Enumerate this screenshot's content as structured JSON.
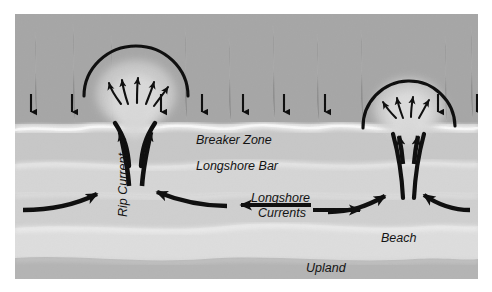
{
  "figure": {
    "type": "diagram",
    "background_color": "#ffffff",
    "frame": {
      "x": 15,
      "y": 14,
      "width": 463,
      "height": 265,
      "border_color": "#ffffff"
    }
  },
  "zones": [
    {
      "name": "open-ocean-water",
      "label": "",
      "color": "#a6a6a6",
      "y_top": 0,
      "y_bottom": 112
    },
    {
      "name": "breaker-foam-band",
      "label": "",
      "color": "#e2e2e2",
      "y_top": 108,
      "y_bottom": 126
    },
    {
      "name": "breaker-zone-water",
      "label": "Breaker Zone",
      "color": "#c9c9c9",
      "y_top": 120,
      "y_bottom": 150
    },
    {
      "name": "longshore-bar-band",
      "label": "Longshore Bar",
      "color": "#d6d6d6",
      "y_top": 148,
      "y_bottom": 178
    },
    {
      "name": "trough-band",
      "label": "",
      "color": "#d0d0d0",
      "y_top": 176,
      "y_bottom": 212
    },
    {
      "name": "beach-band",
      "label": "Beach",
      "color": "#dcdcdc",
      "y_top": 210,
      "y_bottom": 244
    },
    {
      "name": "upland-band",
      "label": "Upland",
      "color": "#b5b5b5",
      "y_top": 242,
      "y_bottom": 265
    }
  ],
  "labels": {
    "breaker_zone": {
      "text": "Breaker Zone",
      "x": 196,
      "y": 140,
      "size": 12.5,
      "rotation": 0
    },
    "longshore_bar": {
      "text": "Longshore Bar",
      "x": 196,
      "y": 166,
      "size": 12.5,
      "rotation": 0
    },
    "rip_current": {
      "text": "Rip Current",
      "x": 110,
      "y": 210,
      "size": 12.5,
      "rotation": -90
    },
    "longshore_currents_line1": {
      "text": "Longshore",
      "x": 250,
      "y": 196,
      "size": 12.5,
      "rotation": 0
    },
    "longshore_currents_line2": {
      "text": "Currents",
      "x": 255,
      "y": 211,
      "size": 12.5,
      "rotation": 0
    },
    "beach": {
      "text": "Beach",
      "x": 380,
      "y": 236,
      "size": 12.5,
      "rotation": 0
    },
    "upland": {
      "text": "Upland",
      "x": 307,
      "y": 265,
      "size": 12.5,
      "rotation": 0
    }
  },
  "wave_arrows": {
    "name": "incoming-wave-direction-arrows",
    "description": "Short downward arrows indicating incoming wave approach",
    "direction": "down",
    "color": "#0d0d0d",
    "y_start": 92,
    "y_end": 118,
    "x_positions": [
      30,
      71,
      160,
      201,
      242,
      283,
      324,
      437,
      477
    ]
  },
  "rip_currents": [
    {
      "name": "rip-current-left",
      "neck_x": 120,
      "head_cap_radius": 52,
      "head_center_y": 78,
      "fan_arrow_count": 5,
      "feeder_arrow_count": 2
    },
    {
      "name": "rip-current-right",
      "neck_x": 393,
      "head_cap_radius": 46,
      "head_center_y": 92,
      "fan_arrow_count": 4,
      "feeder_arrow_count": 2
    }
  ],
  "longshore_arrows": [
    {
      "name": "longshore-arrow-left-inbound",
      "x1": 22,
      "y1": 210,
      "x2": 100,
      "y2": 194,
      "direction": "right"
    },
    {
      "name": "longshore-arrow-mid-left",
      "x1": 227,
      "y1": 204,
      "x2": 145,
      "y2": 196,
      "direction": "left"
    },
    {
      "name": "longshore-arrow-mid-right",
      "x1": 318,
      "y1": 204,
      "x2": 243,
      "y2": 204,
      "direction": "left"
    },
    {
      "name": "longshore-arrow-right-feed",
      "x1": 318,
      "y1": 208,
      "x2": 377,
      "y2": 208,
      "direction": "right"
    },
    {
      "name": "longshore-arrow-to-rip-left",
      "x1": 340,
      "y1": 212,
      "x2": 386,
      "y2": 196,
      "direction": "right"
    },
    {
      "name": "longshore-arrow-to-rip-right",
      "x1": 455,
      "y1": 208,
      "x2": 401,
      "y2": 196,
      "direction": "left"
    }
  ],
  "palette": {
    "ocean": "#a6a6a6",
    "foam": "#ededed",
    "bar": "#d6d6d6",
    "beach": "#dedede",
    "upland": "#b5b5b5",
    "ink": "#0d0d0d"
  }
}
